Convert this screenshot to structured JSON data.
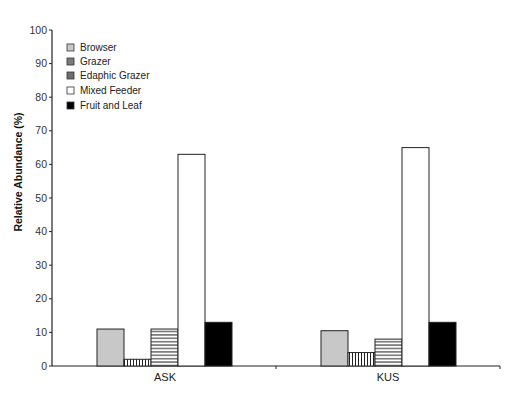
{
  "chart_data": {
    "type": "bar",
    "title": "",
    "xlabel": "",
    "ylabel": "Relative Abundance (%)",
    "ylim": [
      0,
      100
    ],
    "yticks": [
      "0",
      "10",
      "20",
      "30",
      "40",
      "50",
      "60",
      "70",
      "80",
      "90",
      "100"
    ],
    "grid": false,
    "legend_position": "top-left",
    "categories": [
      "ASK",
      "KUS"
    ],
    "series": [
      {
        "name": "Browser",
        "values": [
          11,
          10.5
        ],
        "fill": "#c8c8c8",
        "pattern": "solid"
      },
      {
        "name": "Grazer",
        "values": [
          2,
          4
        ],
        "fill": "#ffffff",
        "pattern": "vertical-stripes"
      },
      {
        "name": "Edaphic Grazer",
        "values": [
          11,
          8
        ],
        "fill": "#ffffff",
        "pattern": "horizontal-stripes"
      },
      {
        "name": "Mixed Feeder",
        "values": [
          63,
          65
        ],
        "fill": "#ffffff",
        "pattern": "solid"
      },
      {
        "name": "Fruit and Leaf",
        "values": [
          13,
          13
        ],
        "fill": "#000000",
        "pattern": "solid"
      }
    ],
    "legend_swatches": [
      "#c8c8c8",
      "#7a7a7a",
      "#6e6e6e",
      "#ffffff",
      "#000000"
    ]
  }
}
